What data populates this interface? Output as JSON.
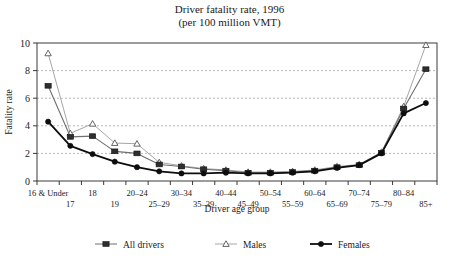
{
  "chart_data": {
    "type": "line",
    "title": "Driver fatality rate, 1996",
    "subtitle": "(per 100 million VMT)",
    "xlabel": "Driver age group",
    "ylabel": "Fatality rate",
    "ylim": [
      0,
      10
    ],
    "yticks": [
      0,
      2,
      4,
      6,
      8,
      10
    ],
    "grid": "horizontal-dotted",
    "legend_position": "bottom",
    "categories": [
      "16 & Under",
      "17",
      "18",
      "19",
      "20–24",
      "25–29",
      "30–34",
      "35–39",
      "40–44",
      "45–49",
      "50–54",
      "55–59",
      "60–64",
      "65–69",
      "70–74",
      "75–79",
      "80–84",
      "85+"
    ],
    "series": [
      {
        "name": "All drivers",
        "marker": "square-filled",
        "color": "#3a3a3a",
        "values": [
          6.9,
          3.2,
          3.25,
          2.15,
          2.0,
          1.2,
          1.05,
          0.85,
          0.75,
          0.6,
          0.6,
          0.65,
          0.75,
          1.0,
          1.15,
          2.05,
          5.25,
          8.1
        ]
      },
      {
        "name": "Males",
        "marker": "triangle-open",
        "color": "#9a9a9a",
        "values": [
          9.25,
          3.45,
          4.15,
          2.75,
          2.7,
          1.35,
          1.1,
          0.9,
          0.8,
          0.65,
          0.65,
          0.7,
          0.8,
          1.05,
          1.2,
          2.1,
          5.4,
          9.85
        ]
      },
      {
        "name": "Females",
        "marker": "circle-filled",
        "color": "#0d0d0d",
        "values": [
          4.3,
          2.55,
          1.95,
          1.4,
          1.0,
          0.7,
          0.55,
          0.55,
          0.6,
          0.55,
          0.55,
          0.6,
          0.7,
          0.95,
          1.15,
          2.0,
          4.9,
          5.65
        ]
      }
    ]
  },
  "axis": {
    "y_label": "Fatality rate",
    "x_label": "Driver age group",
    "y_tick_labels": [
      "0",
      "2",
      "4",
      "6",
      "8",
      "10"
    ]
  },
  "legend": {
    "items": [
      {
        "label": "All drivers"
      },
      {
        "label": "Males"
      },
      {
        "label": "Females"
      }
    ]
  }
}
